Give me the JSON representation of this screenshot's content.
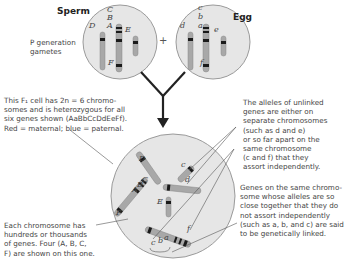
{
  "sperm": {
    "title": "Sperm",
    "genes": [
      "C",
      "B",
      "A",
      "D",
      "E",
      "F"
    ]
  },
  "egg": {
    "title": "Egg",
    "genes": [
      "c",
      "b",
      "a",
      "d",
      "e",
      "f"
    ]
  },
  "plus": "+",
  "p_generation": {
    "line1": "P generation",
    "line2": "gametes"
  },
  "f1_note": {
    "line1": "This F₁ cell has 2n = 6 chromo-",
    "line2": "somes and is heterozygous for all",
    "line3": "six genes shown (AaBbCcDdEeFf).",
    "line4": "Red = maternal; blue = paternal."
  },
  "unlinked_note": {
    "line1": "The alleles of unlinked",
    "line2": "genes are either on",
    "line3": "separate chromosomes",
    "line4": "(such as d and e)",
    "line5": "or so far apart on the",
    "line6": "same chromosome",
    "line7": "(c and f) that they",
    "line8": "assort independently."
  },
  "linked_note": {
    "line1": "Genes on the same chromo-",
    "line2": "some whose alleles are so",
    "line3": "close together that they do",
    "line4": "not assort independently",
    "line5": "(such as a, b, and c) are said",
    "line6": "to be genetically linked."
  },
  "chromosome_note": {
    "line1": "Each chromosome has",
    "line2": "hundreds or thousands",
    "line3": "of genes. Four (A, B, C,",
    "line4": "F) are shown on this one."
  },
  "f1_genes": {
    "D": "D",
    "c_small": "c",
    "d": "d",
    "E": "E",
    "C": "C",
    "B": "B",
    "A": "A",
    "F": "F",
    "f": "f",
    "cba": [
      "c",
      "b",
      "a"
    ]
  },
  "colors": {
    "cell_fill": "#e6e6e6",
    "cell_stroke": "#9a9a9a",
    "chromosome": "#a8a8a8",
    "band": "#1a1a1a",
    "arrow": "#222222"
  }
}
